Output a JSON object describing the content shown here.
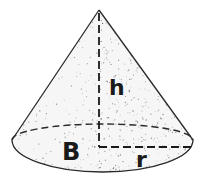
{
  "diagram": {
    "labels": {
      "height": "h",
      "base_area": "B",
      "radius": "r"
    },
    "colors": {
      "stroke": "#2a2a2a",
      "fill": "#f4f4f4",
      "stipple": "#555555",
      "background": "#ffffff"
    }
  }
}
